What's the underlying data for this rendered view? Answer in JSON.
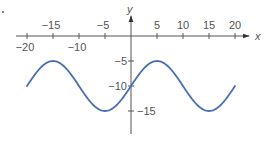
{
  "chart_data": {
    "type": "line",
    "title": "",
    "xlabel": "x",
    "ylabel": "y",
    "xlim": [
      -20,
      20
    ],
    "ylim": [
      -17,
      0
    ],
    "grid": false,
    "legend": null,
    "function": "y = -10 + 5 sin(pi x / 10)",
    "x_ticks": [
      -20,
      -15,
      -10,
      -5,
      5,
      10,
      15,
      20
    ],
    "x_tick_labels": [
      "−20",
      "−15",
      "−10",
      "−5",
      "5",
      "10",
      "15",
      "20"
    ],
    "y_ticks": [
      -5,
      -10,
      -15
    ],
    "y_tick_labels": [
      "−5",
      "−10",
      "−15"
    ],
    "series": [
      {
        "name": "sinusoid",
        "color": "#4a6fb0",
        "x": [
          -20,
          -17.5,
          -15,
          -12.5,
          -10,
          -7.5,
          -5,
          -2.5,
          0,
          2.5,
          5,
          7.5,
          10,
          12.5,
          15,
          17.5,
          20
        ],
        "y": [
          -10,
          -6.46,
          -5,
          -6.46,
          -10,
          -13.54,
          -15,
          -13.54,
          -10,
          -6.46,
          -5,
          -6.46,
          -10,
          -13.54,
          -15,
          -13.54,
          -10
        ]
      }
    ],
    "key_points": {
      "maxima": [
        [
          -15,
          -5
        ],
        [
          5,
          -5
        ]
      ],
      "minima": [
        [
          -5,
          -15
        ],
        [
          15,
          -15
        ]
      ],
      "midline_crossings": [
        [
          -20,
          -10
        ],
        [
          -10,
          -10
        ],
        [
          0,
          -10
        ],
        [
          10,
          -10
        ],
        [
          20,
          -10
        ]
      ]
    }
  },
  "colors": {
    "curve": "#4a6fb0",
    "axis": "#555555",
    "text": "#555555"
  }
}
